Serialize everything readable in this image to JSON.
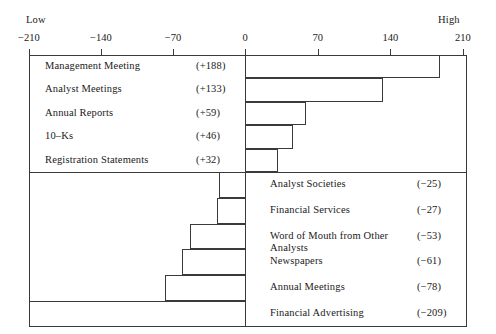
{
  "axis": {
    "low_label": "Low",
    "high_label": "High",
    "ticks": [
      {
        "label": "−210",
        "value": -210
      },
      {
        "label": "−140",
        "value": -140
      },
      {
        "label": "−70",
        "value": -70
      },
      {
        "label": "0",
        "value": 0
      },
      {
        "label": "70",
        "value": 70
      },
      {
        "label": "140",
        "value": 140
      },
      {
        "label": "210",
        "value": 210
      }
    ]
  },
  "positive_rows": [
    {
      "label": "Management Meeting",
      "value_label": "(+188)",
      "value": 188
    },
    {
      "label": "Analyst Meetings",
      "value_label": "(+133)",
      "value": 133
    },
    {
      "label": "Annual Reports",
      "value_label": "(+59)",
      "value": 59
    },
    {
      "label": "10–Ks",
      "value_label": "(+46)",
      "value": 46
    },
    {
      "label": "Registration Statements",
      "value_label": "(+32)",
      "value": 32
    }
  ],
  "negative_rows": [
    {
      "label": "Analyst Societies",
      "value_label": "(−25)",
      "value": -25
    },
    {
      "label": "Financial Services",
      "value_label": "(−27)",
      "value": -27
    },
    {
      "label": "Word of Mouth from Other\n Analysts",
      "value_label": "(−53)",
      "value": -53
    },
    {
      "label": "Newspapers",
      "value_label": "(−61)",
      "value": -61
    },
    {
      "label": "Annual Meetings",
      "value_label": "(−78)",
      "value": -78
    },
    {
      "label": "Financial Advertising",
      "value_label": "(−209)",
      "value": -209
    }
  ],
  "chart_data": {
    "type": "bar",
    "orientation": "horizontal",
    "title": "",
    "subtitle": "",
    "xlabel": "",
    "ylabel": "",
    "xlim": [
      -210,
      210
    ],
    "xticks": [
      -210,
      -140,
      -70,
      0,
      70,
      140,
      210
    ],
    "grid": false,
    "legend": null,
    "annotations": [
      "Low",
      "High"
    ],
    "categories": [
      "Management Meeting",
      "Analyst Meetings",
      "Annual Reports",
      "10-Ks",
      "Registration Statements",
      "Analyst Societies",
      "Financial Services",
      "Word of Mouth from Other Analysts",
      "Newspapers",
      "Annual Meetings",
      "Financial Advertising"
    ],
    "values": [
      188,
      133,
      59,
      46,
      32,
      -25,
      -27,
      -53,
      -61,
      -78,
      -209
    ],
    "value_labels": [
      "(+188)",
      "(+133)",
      "(+59)",
      "(+46)",
      "(+32)",
      "(-25)",
      "(-27)",
      "(-53)",
      "(-61)",
      "(-78)",
      "(-209)"
    ]
  },
  "style": {
    "line_color": "#3a3a3a",
    "text_color": "#1a1a1a",
    "background": "#ffffff"
  }
}
